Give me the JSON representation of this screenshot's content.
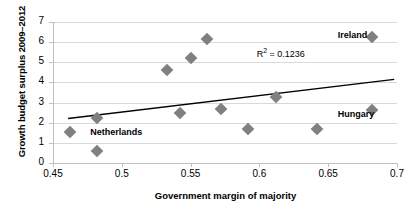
{
  "chart_data": {
    "type": "scatter",
    "title": "",
    "xlabel": "Government margin of majority",
    "ylabel": "Growth budget surplus 2009–2012",
    "xlim": [
      0.45,
      0.7
    ],
    "ylim": [
      0,
      7
    ],
    "xticks": [
      "0.45",
      "0.5",
      "0.55",
      "0.6",
      "0.65",
      "0.7"
    ],
    "yticks": [
      "0",
      "1",
      "2",
      "3",
      "4",
      "5",
      "6",
      "7"
    ],
    "grid": "horizontal",
    "legend": "none",
    "marker": "diamond",
    "marker_color": "#808080",
    "points": [
      {
        "x": 0.462,
        "y": 1.52,
        "label": "Netherlands"
      },
      {
        "x": 0.482,
        "y": 2.21,
        "label": ""
      },
      {
        "x": 0.482,
        "y": 0.62,
        "label": ""
      },
      {
        "x": 0.533,
        "y": 4.6,
        "label": ""
      },
      {
        "x": 0.542,
        "y": 2.49,
        "label": ""
      },
      {
        "x": 0.55,
        "y": 5.19,
        "label": ""
      },
      {
        "x": 0.562,
        "y": 6.17,
        "label": ""
      },
      {
        "x": 0.572,
        "y": 2.67,
        "label": ""
      },
      {
        "x": 0.592,
        "y": 1.68,
        "label": ""
      },
      {
        "x": 0.612,
        "y": 3.28,
        "label": ""
      },
      {
        "x": 0.642,
        "y": 1.68,
        "label": ""
      },
      {
        "x": 0.682,
        "y": 2.65,
        "label": "Hungary"
      },
      {
        "x": 0.682,
        "y": 6.27,
        "label": "Ireland"
      }
    ],
    "trendline": {
      "type": "linear",
      "x_start": 0.461,
      "y_start": 2.21,
      "x_end": 0.698,
      "y_end": 4.15,
      "color": "#000000"
    },
    "annotations": [
      {
        "name": "r-squared",
        "text": "R² = 0.1236",
        "x": 0.598,
        "y": 5.45
      },
      {
        "name": "ireland-label",
        "text": "Ireland",
        "x": 0.657,
        "y": 6.3
      },
      {
        "name": "hungary-label",
        "text": "Hungary",
        "x": 0.657,
        "y": 2.37
      },
      {
        "name": "netherlands-label",
        "text": "Netherlands",
        "x": 0.477,
        "y": 1.5
      }
    ]
  },
  "axis": {
    "x_title": "Government margin of majority",
    "y_title": "Growth budget surplus 2009–2012"
  },
  "annotation_text": {
    "r_squared": "R² = 0.1236",
    "ireland": "Ireland",
    "hungary": "Hungary",
    "netherlands": "Netherlands"
  }
}
